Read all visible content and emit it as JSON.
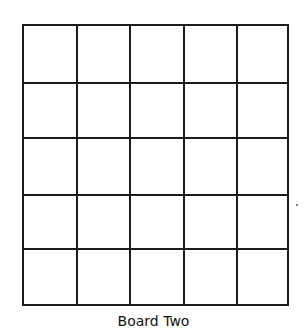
{
  "board": {
    "title": "Board Two",
    "rows": 5,
    "columns": 5,
    "cells": [
      [
        "",
        "",
        "",
        "",
        ""
      ],
      [
        "",
        "",
        "",
        "",
        ""
      ],
      [
        "",
        "",
        "",
        "",
        ""
      ],
      [
        "",
        "",
        "",
        "",
        ""
      ],
      [
        "",
        "",
        "",
        "",
        ""
      ]
    ],
    "line_color": "#1a1a1a",
    "background": "#ffffff"
  }
}
